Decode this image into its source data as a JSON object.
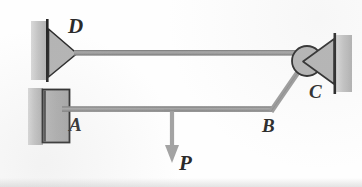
{
  "figure": {
    "kind": "statics-free-body-diagram",
    "background_color": "#fefefe",
    "labels": {
      "D": "D",
      "A": "A",
      "B": "B",
      "C": "C",
      "P": "P"
    },
    "colors": {
      "member": "#9a9a9a",
      "member_outline": "#6f6f6f",
      "support_fill": "#b4b4b4",
      "support_outline": "#2e2e2e",
      "wall_fill": "#bcbcbc",
      "wall_edge": "#1f1f1f",
      "arrow": "#a0a0a0",
      "text": "#2b2b2b"
    },
    "geometry": {
      "top_member": {
        "from": "D",
        "to": "C",
        "y": 53,
        "x1": 74,
        "x2": 300
      },
      "bottom_member": {
        "from": "A",
        "to": "B",
        "y": 109,
        "x1": 62,
        "x2": 272
      },
      "diagonal_member": {
        "from": "B",
        "to": "C",
        "x1": 272,
        "y1": 109,
        "x2": 303,
        "y2": 63
      },
      "load_arrow": {
        "at_x": 172,
        "from_y": 110,
        "to_y": 160,
        "direction": "down"
      }
    },
    "elements": {
      "pin_support_D": "triangle-pin-support",
      "fixed_block_A": "rectangular-fixed-block",
      "pin_joint_C": "circular-pin-with-triangle-support",
      "wall_left_upper": "hatched-wall",
      "wall_left_lower": "hatched-wall",
      "wall_right": "hatched-wall"
    }
  }
}
